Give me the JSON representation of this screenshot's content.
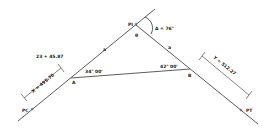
{
  "diagram": {
    "points": {
      "pc": "PC",
      "a": "A",
      "pi": "PI",
      "b": "B",
      "pt": "PT",
      "vertex_o": "θ"
    },
    "labels": {
      "delta": "Δ = 76°",
      "station": "23 + 45.87",
      "x_dim": "X = 495.70",
      "y_dim": "Y = 512.27",
      "angle_a": "34° 00'",
      "angle_b": "42° 00'",
      "side_a": "a",
      "side_b": "a"
    },
    "colors": {
      "line": "#333333",
      "background": "#ffffff"
    }
  }
}
